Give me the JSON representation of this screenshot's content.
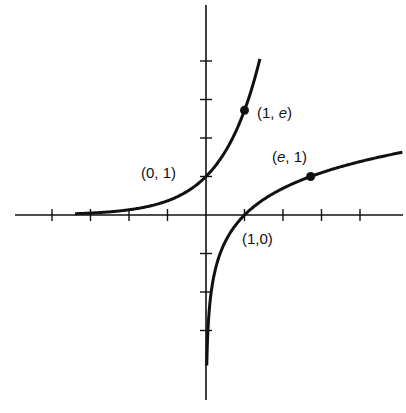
{
  "chart_data": {
    "type": "line",
    "title": "",
    "xlabel": "",
    "ylabel": "",
    "xlim": [
      -5.2,
      5.2
    ],
    "ylim": [
      -5.0,
      5.6
    ],
    "grid": false,
    "x_ticks": [
      -4,
      -3,
      -2,
      -1,
      1,
      2,
      3,
      4
    ],
    "y_ticks": [
      -3,
      -2,
      -1,
      1,
      2,
      3,
      4
    ],
    "series": [
      {
        "name": "y = e^x",
        "function": "exp",
        "x_range": [
          -3.4,
          1.4
        ]
      },
      {
        "name": "y = ln x",
        "function": "ln",
        "x_range": [
          0.02,
          5.1
        ]
      }
    ],
    "points": [
      {
        "x": 0,
        "y": 1,
        "label": "(0, 1)",
        "marker": false
      },
      {
        "x": 1,
        "y": 2.718,
        "label": "(1, e)",
        "marker": true
      },
      {
        "x": 2.718,
        "y": 1,
        "label": "(e, 1)",
        "marker": true
      },
      {
        "x": 1,
        "y": 0,
        "label": "(1,0)",
        "marker": false
      }
    ]
  },
  "labels": {
    "p01": "(0, 1)",
    "p1e_a": "(1, ",
    "p1e_e": "e",
    "p1e_b": ")",
    "pe1_a": "(",
    "pe1_e": "e",
    "pe1_b": ", 1)",
    "p10": "(1,0)"
  }
}
